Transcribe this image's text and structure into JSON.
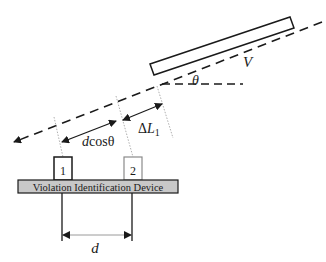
{
  "diagram": {
    "type": "schematic",
    "labels": {
      "velocity": "V",
      "angle": "θ",
      "dcos_d": "d",
      "dcos_rest": "cosθ",
      "delta": "Δ",
      "delta_L": "L",
      "delta_sub": "1",
      "sensor_1": "1",
      "sensor_2": "2",
      "device": "Violation Identification Device",
      "spacing": "d"
    },
    "colors": {
      "line": "#1a1a1a",
      "device_fill": "#c8c8c8",
      "sensor2_border": "#8a8a8a",
      "dotted": "#9a9a9a"
    }
  }
}
